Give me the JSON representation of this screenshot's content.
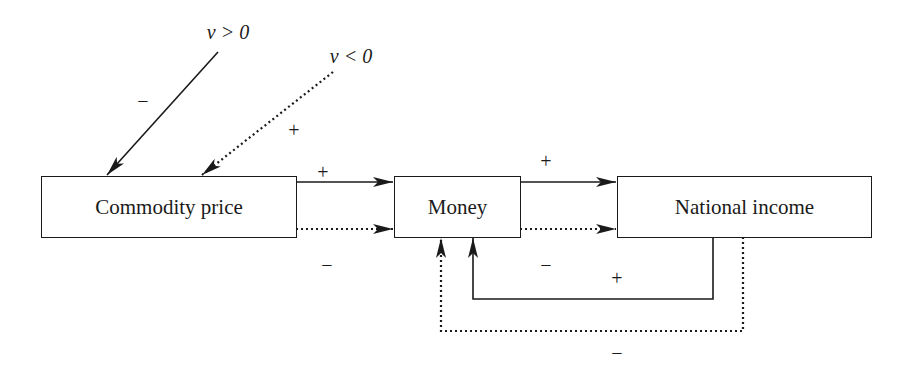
{
  "nodes": {
    "commodity_price": "Commodity price",
    "money": "Money",
    "national_income": "National income"
  },
  "conditions": {
    "v_positive": "v > 0",
    "v_negative": "v < 0"
  },
  "signs": {
    "v_pos_to_price": "−",
    "v_neg_to_price": "+",
    "price_to_money_solid": "+",
    "price_to_money_dotted": "−",
    "money_to_income_solid": "+",
    "money_to_income_dotted": "−",
    "income_to_money_solid": "+",
    "income_to_money_dotted": "−"
  },
  "legend_semantics": {
    "solid_line": "case v > 0",
    "dotted_line": "case v < 0"
  },
  "colors": {
    "stroke": "#1a1a1a",
    "background": "#ffffff"
  }
}
